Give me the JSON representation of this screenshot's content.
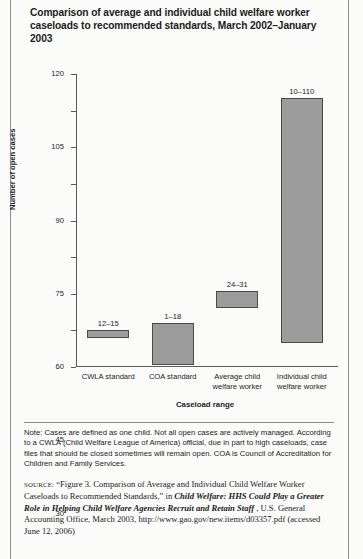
{
  "figure": {
    "title": "Comparison of average and individual child welfare worker caseloads to recommended standards, March 2002–January 2003",
    "note": "Note: Cases are defined as one child. Not all open cases are actively managed. According to a CWLA (Child Welfare League of America) official, due in part to high caseloads, case files that should be closed sometimes will remain open. COA is Council of Accreditation for Children and Family Services.",
    "source_label": "source:",
    "source_text_1": "“Figure 3. Comparison of Average and Individual Child Welfare Worker Caseloads to Recommended Standards,” in ",
    "source_title_italic": "Child Welfare: HHS Could Play a Greater Role in Helping Child Welfare Agencies Recruit and Retain Staff",
    "source_text_2": ", U.S. General Accounting Office, March 2003, http://www.gao.gov/new.items/d03357.pdf (accessed June 12, 2006)"
  },
  "chart_data": {
    "type": "bar",
    "title": "Comparison of average and individual child welfare worker caseloads to recommended standards, March 2002–January 2003",
    "xlabel": "Caseload range",
    "ylabel": "Number of open cases",
    "ylim": [
      0,
      120
    ],
    "yticks": [
      0,
      15,
      30,
      45,
      60,
      75,
      90,
      105,
      120
    ],
    "grid": false,
    "legend": "none",
    "note": "Bars are floating ranges (low–high values of open cases)",
    "categories": [
      "CWLA standard",
      "COA standard",
      "Average child welfare worker",
      "Individual child welfare worker"
    ],
    "bars": [
      {
        "category": "CWLA standard",
        "low": 12,
        "high": 15,
        "label": "12–15"
      },
      {
        "category": "COA standard",
        "low": 1,
        "high": 18,
        "label": "1–18"
      },
      {
        "category": "Average child welfare worker",
        "low": 24,
        "high": 31,
        "label": "24–31"
      },
      {
        "category": "Individual child welfare worker",
        "low": 10,
        "high": 110,
        "label": "10–110"
      }
    ],
    "bar_color": "#9c9c9c",
    "bar_border_color": "#4a4a4a",
    "axis_color": "#5a5a5a"
  }
}
